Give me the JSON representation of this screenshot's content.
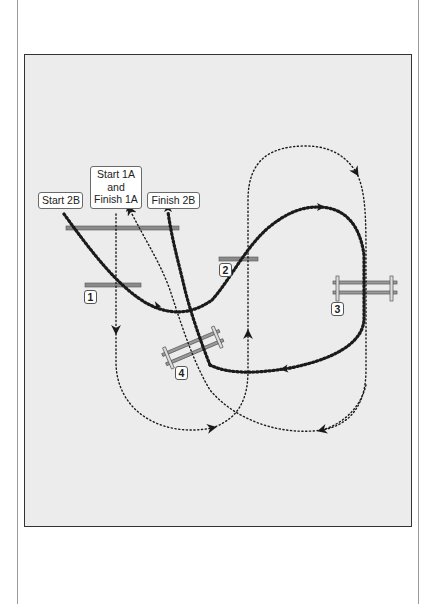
{
  "diagram": {
    "type": "horse-riding-course-map",
    "colors": {
      "background": "#ececec",
      "panel_border": "#333333",
      "path": "#1a1a1a",
      "pole": "#777777"
    },
    "labels": {
      "start_2b": "Start 2B",
      "start_1a_line1": "Start 1A",
      "start_1a_line2": "and",
      "start_1a_line3": "Finish 1A",
      "finish_2b": "Finish 2B"
    },
    "obstacles": [
      {
        "number": "1",
        "kind": "ground-pole"
      },
      {
        "number": "2",
        "kind": "ground-pole"
      },
      {
        "number": "3",
        "kind": "vertical-fence"
      },
      {
        "number": "4",
        "kind": "vertical-fence-angled"
      }
    ],
    "routes": [
      {
        "name": "Course 1A",
        "style": "fine-dotted",
        "from": "Start 1A",
        "to": "Finish 1A"
      },
      {
        "name": "Course 2B",
        "style": "heavy-dotted",
        "from": "Start 2B",
        "to": "Finish 2B"
      }
    ]
  }
}
